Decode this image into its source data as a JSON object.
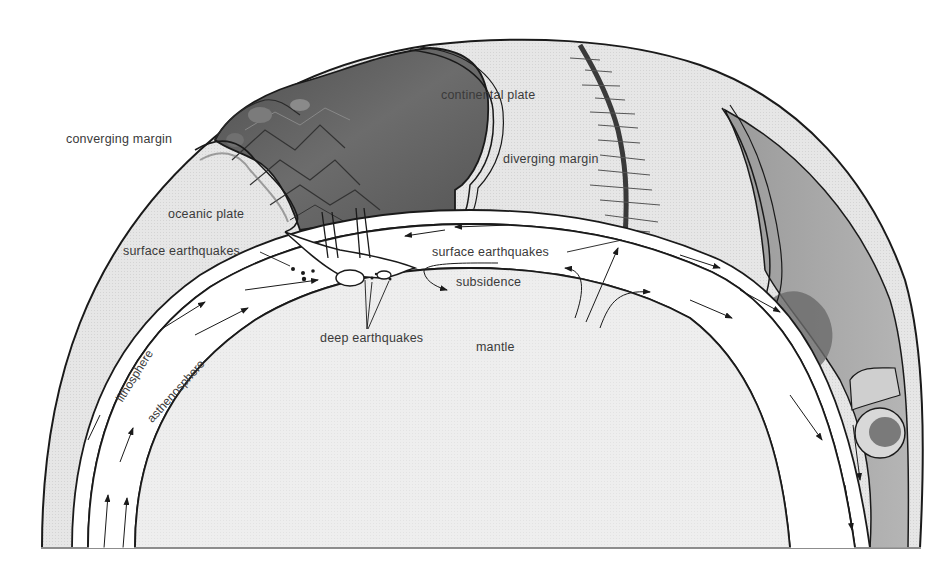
{
  "diagram": {
    "labels": {
      "converging_margin": "converging margin",
      "continental_plate": "continental plate",
      "diverging_margin": "diverging margin",
      "oceanic_plate": "oceanic plate",
      "surface_earthquakes_left": "surface earthquakes",
      "surface_earthquakes_right": "surface earthquakes",
      "subsidence": "subsidence",
      "deep_earthquakes": "deep earthquakes",
      "mantle": "mantle",
      "lithosphere": "lithosphere",
      "asthenosphere": "asthenosphere"
    },
    "colors": {
      "background": "#ffffff",
      "outline": "#1a1a1a",
      "surface_light": "#e4e4e4",
      "continent_dark": "#5e5e5e",
      "mountains": "#4a4a4a",
      "mantle_fill": "#ececec",
      "layer_fill": "#ffffff",
      "right_shell": "#a8a8a8",
      "text": "#3a3a3a"
    }
  }
}
